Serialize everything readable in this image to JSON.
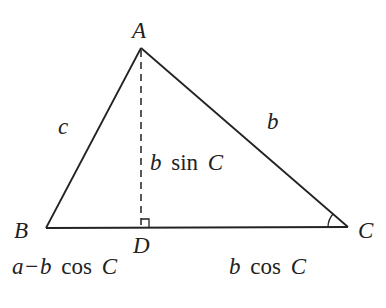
{
  "diagram": {
    "type": "triangle-altitude",
    "vertices": {
      "A": {
        "label": "A",
        "x": 141,
        "y": 48
      },
      "B": {
        "label": "B",
        "x": 46,
        "y": 228
      },
      "C": {
        "label": "C",
        "x": 348,
        "y": 227
      },
      "D": {
        "label": "D",
        "x": 141,
        "y": 228
      }
    },
    "sides": {
      "c": "c",
      "b": "b"
    },
    "altitude_label": {
      "var": "b",
      "fn": "sin",
      "arg": "C"
    },
    "segment_BD": {
      "a": "a",
      "minus": "−",
      "b": "b",
      "fn": "cos",
      "arg": "C"
    },
    "segment_DC": {
      "b": "b",
      "fn": "cos",
      "arg": "C"
    },
    "colors": {
      "line": "#222222",
      "background": "#ffffff"
    }
  }
}
